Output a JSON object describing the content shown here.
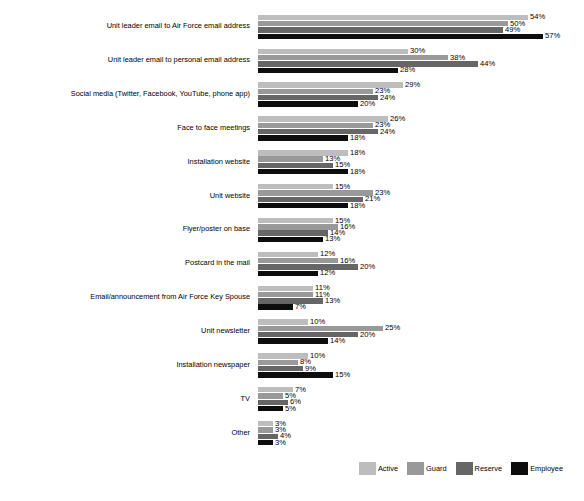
{
  "chart_data": {
    "type": "bar",
    "orientation": "horizontal",
    "title": "",
    "subtitle": "",
    "xlabel": "",
    "ylabel": "",
    "xlim": [
      0,
      60
    ],
    "grid": false,
    "value_suffix": "%",
    "legend_position": "bottom-right",
    "categories": [
      "Unit leader email to Air Force email address",
      "Unit leader email to personal email address",
      "Social media (Twitter, Facebook, YouTube, phone app)",
      "Face to face meetings",
      "Installation website",
      "Unit website",
      "Flyer/poster on base",
      "Postcard in the mail",
      "Email/announcement from Air Force Key Spouse",
      "Unit newsletter",
      "Installation newspaper",
      "TV",
      "Other"
    ],
    "series": [
      {
        "name": "Active",
        "color": "#bdbdbd",
        "values": [
          54,
          30,
          29,
          26,
          18,
          15,
          15,
          12,
          11,
          10,
          10,
          7,
          3
        ],
        "labels": [
          "54%",
          "30%",
          "29%",
          "26%",
          "18%",
          "15%",
          "15%",
          "12%",
          "11%",
          "10%",
          "10%",
          "7%",
          "3%"
        ]
      },
      {
        "name": "Guard",
        "color": "#999999",
        "values": [
          50,
          38,
          23,
          23,
          13,
          23,
          16,
          16,
          11,
          25,
          8,
          5,
          3
        ],
        "labels": [
          "50%",
          "38%",
          "23%",
          "23%",
          "13%",
          "23%",
          "16%",
          "16%",
          "11%",
          "25%",
          "8%",
          "5%",
          "3%"
        ]
      },
      {
        "name": "Reserve",
        "color": "#666666",
        "values": [
          49,
          44,
          24,
          24,
          15,
          21,
          14,
          20,
          13,
          20,
          9,
          6,
          4
        ],
        "labels": [
          "49%",
          "44%",
          "24%",
          "24%",
          "15%",
          "21%",
          "14%",
          "20%",
          "13%",
          "20%",
          "9%",
          "6%",
          "4%"
        ]
      },
      {
        "name": "Employee",
        "color": "#0d0d0d",
        "values": [
          57,
          28,
          20,
          18,
          18,
          18,
          13,
          12,
          7,
          14,
          15,
          5,
          3
        ],
        "labels": [
          "57%",
          "28%",
          "20%",
          "18%",
          "18%",
          "18%",
          "13%",
          "12%",
          "7%",
          "14%",
          "15%",
          "5%",
          "3%"
        ]
      }
    ]
  },
  "legend": {
    "items": [
      {
        "label": "Active",
        "color": "#bdbdbd"
      },
      {
        "label": "Guard",
        "color": "#999999"
      },
      {
        "label": "Reserve",
        "color": "#666666"
      },
      {
        "label": "Employee",
        "color": "#0d0d0d"
      }
    ]
  }
}
